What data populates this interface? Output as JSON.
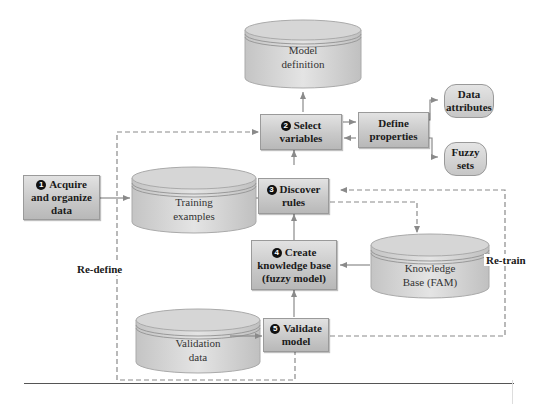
{
  "diagram": {
    "type": "flowchart",
    "steps": [
      {
        "num": "1",
        "line1": "Acquire",
        "line2": "and organize",
        "line3": "data"
      },
      {
        "num": "2",
        "line1": "Select",
        "line2": "variables"
      },
      {
        "num": "3",
        "line1": "Discover",
        "line2": "rules"
      },
      {
        "num": "4",
        "line1": "Create",
        "line2": "knowledge base",
        "line3": "(fuzzy model)"
      },
      {
        "num": "5",
        "line1": "Validate",
        "line2": "model"
      }
    ],
    "process": {
      "line1": "Define",
      "line2": "properties"
    },
    "outputs": [
      {
        "line1": "Data",
        "line2": "attributes"
      },
      {
        "line1": "Fuzzy",
        "line2": "sets"
      }
    ],
    "stores": {
      "model_definition": {
        "line1": "Model",
        "line2": "definition"
      },
      "training_examples": {
        "line1": "Training",
        "line2": "examples"
      },
      "knowledge_base": {
        "line1": "Knowledge",
        "line2": "Base (FAM)"
      },
      "validation_data": {
        "line1": "Validation",
        "line2": "data"
      }
    },
    "loop_labels": {
      "redefine": "Re-define",
      "retrain": "Re-train"
    },
    "colors": {
      "box_fill": "#c9c9c9",
      "line": "#8a8a8a",
      "text": "#1a1a1a"
    }
  }
}
